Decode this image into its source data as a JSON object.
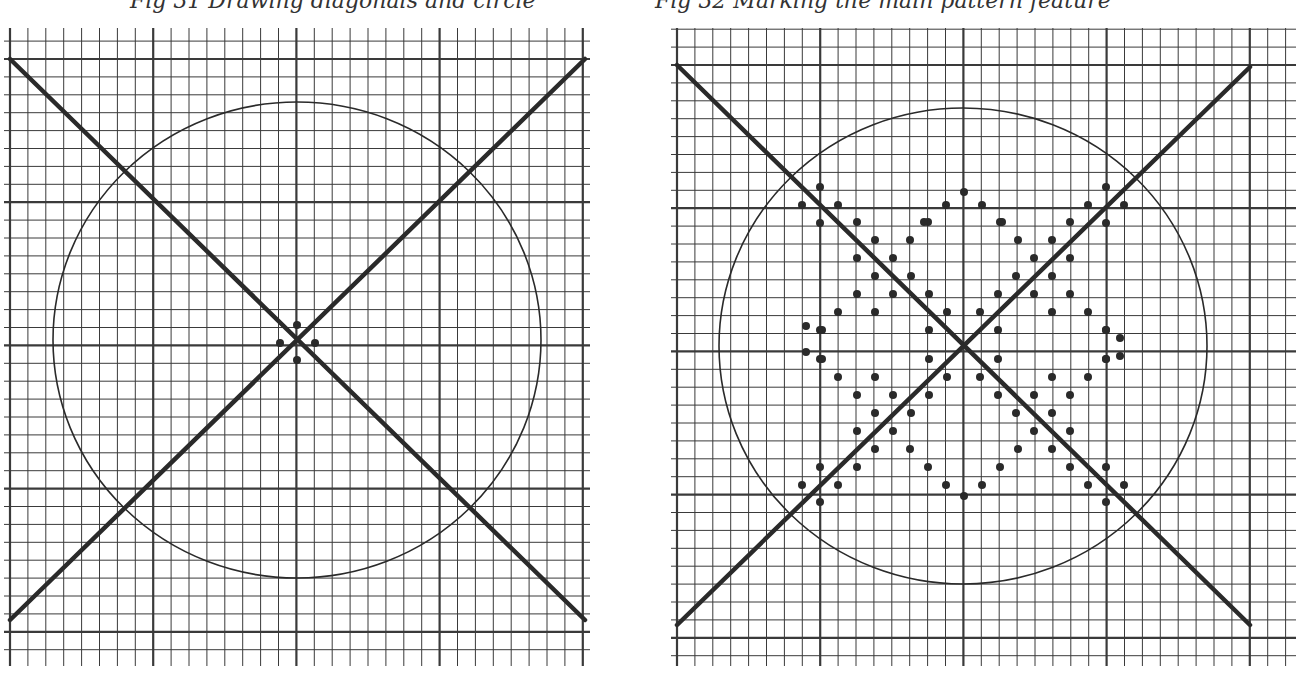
{
  "captions": {
    "left": "Fig 31 Drawing diagonals and circle",
    "right": "Fig 32 Marking the main pattern feature"
  },
  "style": {
    "grid_color": "#3a3a3a",
    "ink_color": "#2a2a2a",
    "paper_color": "#ffffff"
  },
  "panels": [
    {
      "name": "left",
      "grid": {
        "x0": 10,
        "x1": 590,
        "y0": 28,
        "y1": 666,
        "cell": 17.9,
        "origin_x": 10,
        "origin_y": 59,
        "major_every": 8
      },
      "diagonals": [
        [
          10,
          59,
          585,
          620
        ],
        [
          10,
          620,
          585,
          59
        ]
      ],
      "circle": {
        "cx": 297,
        "cy": 340,
        "rx": 244,
        "ry": 238
      },
      "dots": [
        [
          297,
          325
        ],
        [
          280,
          343
        ],
        [
          315,
          343
        ],
        [
          297,
          360
        ]
      ]
    },
    {
      "name": "right",
      "grid": {
        "x0": 677,
        "x1": 1296,
        "y0": 28,
        "y1": 666,
        "cell": 17.9,
        "origin_x": 677,
        "origin_y": 65,
        "major_every": 8
      },
      "diagonals": [
        [
          677,
          65,
          1250,
          625
        ],
        [
          677,
          625,
          1250,
          67
        ]
      ],
      "circle": {
        "cx": 963,
        "cy": 346,
        "rx": 244,
        "ry": 238
      },
      "dots": [
        [
          820,
          187
        ],
        [
          802,
          205
        ],
        [
          838,
          205
        ],
        [
          820,
          223
        ],
        [
          857,
          222
        ],
        [
          875,
          240
        ],
        [
          857,
          258
        ],
        [
          893,
          258
        ],
        [
          875,
          276
        ],
        [
          911,
          276
        ],
        [
          893,
          294
        ],
        [
          857,
          294
        ],
        [
          875,
          312
        ],
        [
          838,
          312
        ],
        [
          820,
          330
        ],
        [
          929,
          294
        ],
        [
          947,
          312
        ],
        [
          929,
          330
        ],
        [
          1106,
          187
        ],
        [
          1124,
          205
        ],
        [
          1088,
          205
        ],
        [
          1106,
          223
        ],
        [
          1070,
          222
        ],
        [
          1052,
          240
        ],
        [
          1070,
          258
        ],
        [
          1034,
          258
        ],
        [
          1052,
          276
        ],
        [
          1016,
          276
        ],
        [
          1034,
          294
        ],
        [
          1070,
          294
        ],
        [
          1052,
          312
        ],
        [
          1088,
          312
        ],
        [
          1106,
          330
        ],
        [
          998,
          294
        ],
        [
          980,
          312
        ],
        [
          998,
          330
        ],
        [
          820,
          502
        ],
        [
          802,
          485
        ],
        [
          838,
          485
        ],
        [
          820,
          467
        ],
        [
          857,
          467
        ],
        [
          875,
          449
        ],
        [
          857,
          431
        ],
        [
          893,
          431
        ],
        [
          875,
          413
        ],
        [
          911,
          413
        ],
        [
          893,
          395
        ],
        [
          857,
          395
        ],
        [
          875,
          377
        ],
        [
          838,
          377
        ],
        [
          820,
          359
        ],
        [
          929,
          395
        ],
        [
          947,
          377
        ],
        [
          929,
          359
        ],
        [
          1106,
          502
        ],
        [
          1124,
          485
        ],
        [
          1088,
          485
        ],
        [
          1106,
          467
        ],
        [
          1070,
          467
        ],
        [
          1052,
          449
        ],
        [
          1070,
          431
        ],
        [
          1034,
          431
        ],
        [
          1052,
          413
        ],
        [
          1016,
          413
        ],
        [
          1034,
          395
        ],
        [
          1070,
          395
        ],
        [
          1052,
          377
        ],
        [
          1088,
          377
        ],
        [
          1106,
          359
        ],
        [
          998,
          395
        ],
        [
          980,
          377
        ],
        [
          998,
          359
        ],
        [
          946,
          205
        ],
        [
          964,
          192
        ],
        [
          982,
          205
        ],
        [
          1000,
          222
        ],
        [
          928,
          222
        ],
        [
          910,
          240
        ],
        [
          1018,
          240
        ],
        [
          946,
          485
        ],
        [
          964,
          496
        ],
        [
          982,
          485
        ],
        [
          1000,
          467
        ],
        [
          928,
          467
        ],
        [
          910,
          449
        ],
        [
          1018,
          449
        ],
        [
          806,
          326
        ],
        [
          806,
          352
        ],
        [
          822,
          330
        ],
        [
          822,
          359
        ],
        [
          1120,
          338
        ],
        [
          1120,
          356
        ],
        [
          1106,
          330
        ],
        [
          1106,
          359
        ],
        [
          1002,
          222
        ],
        [
          924,
          222
        ]
      ]
    }
  ]
}
